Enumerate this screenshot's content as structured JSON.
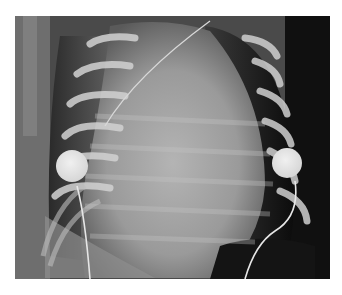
{
  "image": {
    "kind": "chest radiograph",
    "view": "frontal",
    "description": "Frontal chest X-ray of an infant with two round ECG electrode pads on either side of the chest, lead wires running down, and a thin line crossing the upper mediastinum",
    "colors": {
      "background": "#ffffff",
      "dark_lung": "#1a1a1a",
      "soft_tissue": "#9a9a9a",
      "bone": "#cfcfcf",
      "electrode": "#e6e6e6"
    },
    "elements": [
      {
        "name": "left-electrode",
        "shape": "circle"
      },
      {
        "name": "right-electrode",
        "shape": "circle"
      },
      {
        "name": "left-lead-wire",
        "shape": "curve"
      },
      {
        "name": "right-lead-wire",
        "shape": "curve"
      },
      {
        "name": "catheter-line",
        "shape": "line"
      }
    ]
  }
}
